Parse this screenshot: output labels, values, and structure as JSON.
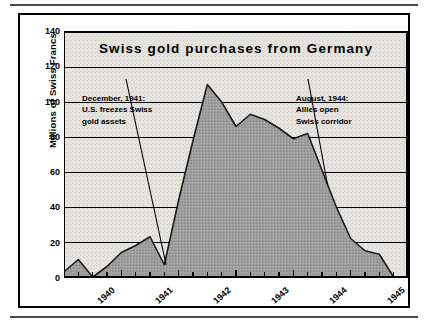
{
  "chart_data": {
    "type": "area",
    "title": "Swiss gold purchases from Germany",
    "xlabel": "",
    "ylabel": "Millions of Swiss Francs",
    "ylim": [
      0,
      140
    ],
    "ytick_labels": [
      "140",
      "120",
      "100",
      "80",
      "60",
      "40",
      "20",
      "0"
    ],
    "ytick_values": [
      140,
      120,
      100,
      80,
      60,
      40,
      20,
      0
    ],
    "xtick_labels": [
      "1940",
      "1941",
      "1942",
      "1943",
      "1944",
      "1945"
    ],
    "xtick_values": [
      1940,
      1941,
      1942,
      1943,
      1944,
      1945
    ],
    "x_unit": "quarter",
    "grid": "horizontal",
    "legend": "none",
    "series_name": "Swiss gold purchases from Germany",
    "x": [
      1940.0,
      1940.25,
      1940.5,
      1940.75,
      1941.0,
      1941.25,
      1941.5,
      1941.75,
      1942.0,
      1942.25,
      1942.5,
      1942.75,
      1943.0,
      1943.25,
      1943.5,
      1943.75,
      1944.0,
      1944.25,
      1944.5,
      1944.75,
      1945.0,
      1945.25,
      1945.5,
      1945.75
    ],
    "values": [
      3,
      10,
      0,
      6,
      14,
      18,
      23,
      7,
      44,
      78,
      110,
      100,
      86,
      93,
      90,
      85,
      79,
      82,
      61,
      40,
      22,
      15,
      13,
      0
    ],
    "annotations": [
      {
        "name": "december-1941",
        "lines": [
          "December, 1941:",
          "U.S. freezes Swiss",
          "gold assets"
        ],
        "points_to_x": 1941.78,
        "points_to_y": 7
      },
      {
        "name": "august-1944",
        "lines": [
          "August, 1944:",
          "Allies open",
          "Swiss corridor"
        ],
        "points_to_x": 1944.6,
        "points_to_y": 52
      }
    ],
    "colors": {
      "area_fill": "#9a9a9a",
      "area_line": "#1a1a1a",
      "plot_background": "#e3e1dc",
      "axis": "#000000",
      "grid": "#000000",
      "page_background": "#ffffff",
      "text": "#000000"
    }
  }
}
